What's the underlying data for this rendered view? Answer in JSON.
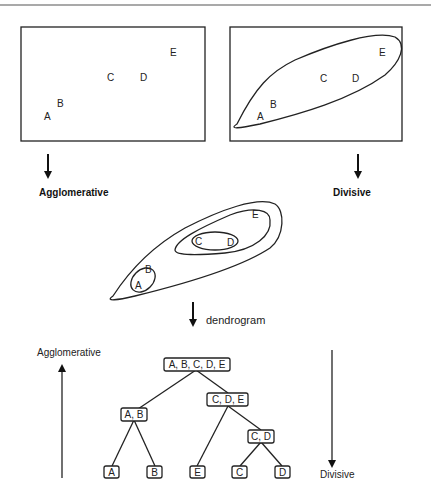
{
  "points": [
    {
      "label": "A"
    },
    {
      "label": "B"
    },
    {
      "label": "C"
    },
    {
      "label": "D"
    },
    {
      "label": "E"
    }
  ],
  "panels": {
    "left_label": "Agglomerative",
    "right_label": "Divisive"
  },
  "middle": {
    "arrow_label": "dendrogram"
  },
  "dendrogram": {
    "left_axis_label": "Agglomerative",
    "right_axis_label": "Divisive",
    "nodes": [
      {
        "id": "root",
        "label": "A, B, C, D, E"
      },
      {
        "id": "ab",
        "label": "A, B"
      },
      {
        "id": "cde",
        "label": "C, D, E"
      },
      {
        "id": "cd",
        "label": "C, D"
      },
      {
        "id": "a",
        "label": "A"
      },
      {
        "id": "b",
        "label": "B"
      },
      {
        "id": "e",
        "label": "E"
      },
      {
        "id": "c",
        "label": "C"
      },
      {
        "id": "d",
        "label": "D"
      }
    ],
    "edges": [
      [
        "root",
        "ab"
      ],
      [
        "root",
        "cde"
      ],
      [
        "ab",
        "a"
      ],
      [
        "ab",
        "b"
      ],
      [
        "cde",
        "e"
      ],
      [
        "cde",
        "cd"
      ],
      [
        "cd",
        "c"
      ],
      [
        "cd",
        "d"
      ]
    ]
  }
}
